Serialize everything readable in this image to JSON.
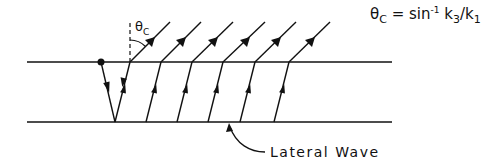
{
  "diagram": {
    "formula": {
      "lhs_symbol": "θ",
      "lhs_sub": "C",
      "equals": "=",
      "func": "sin",
      "func_sup": "-1",
      "k_num": "k",
      "k_num_sub": "3",
      "slash": "/",
      "k_den": "k",
      "k_den_sub": "1"
    },
    "angle_label": {
      "symbol": "θ",
      "sub": "C"
    },
    "annotation": "Lateral Wave",
    "interfaces": {
      "top_y": 62,
      "bottom_y": 122,
      "x_start": 27,
      "x_end": 392
    },
    "source_point": {
      "x": 101,
      "y": 62
    },
    "rays": {
      "count": 6,
      "bottom_x": [
        115,
        146,
        177,
        208,
        240,
        274
      ],
      "top_base_x": [
        130,
        161,
        192,
        223,
        255,
        289
      ],
      "top_end_x": [
        170,
        201,
        233,
        265,
        296,
        330
      ]
    },
    "colors": {
      "stroke": "#111111",
      "background": "#ffffff"
    }
  }
}
